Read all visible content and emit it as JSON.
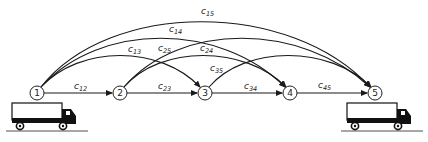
{
  "diagram": {
    "nodes": [
      {
        "id": "1",
        "label": "1",
        "x": 37,
        "y": 93
      },
      {
        "id": "2",
        "label": "2",
        "x": 120,
        "y": 93
      },
      {
        "id": "3",
        "label": "3",
        "x": 205,
        "y": 93
      },
      {
        "id": "4",
        "label": "4",
        "x": 290,
        "y": 93
      },
      {
        "id": "5",
        "label": "5",
        "x": 375,
        "y": 93
      }
    ],
    "edges": [
      {
        "from": "1",
        "to": "2",
        "label": "c",
        "sub": "12"
      },
      {
        "from": "2",
        "to": "3",
        "label": "c",
        "sub": "23"
      },
      {
        "from": "3",
        "to": "4",
        "label": "c",
        "sub": "34"
      },
      {
        "from": "4",
        "to": "5",
        "label": "c",
        "sub": "45"
      },
      {
        "from": "1",
        "to": "3",
        "label": "c",
        "sub": "13"
      },
      {
        "from": "1",
        "to": "4",
        "label": "c",
        "sub": "14"
      },
      {
        "from": "1",
        "to": "5",
        "label": "c",
        "sub": "15"
      },
      {
        "from": "2",
        "to": "4",
        "label": "c",
        "sub": "24"
      },
      {
        "from": "2",
        "to": "5",
        "label": "c",
        "sub": "25"
      },
      {
        "from": "3",
        "to": "5",
        "label": "c",
        "sub": "35"
      }
    ],
    "labels": {
      "c12": {
        "c": "c",
        "sub": "12"
      },
      "c23": {
        "c": "c",
        "sub": "23"
      },
      "c34": {
        "c": "c",
        "sub": "34"
      },
      "c45": {
        "c": "c",
        "sub": "45"
      },
      "c13": {
        "c": "c",
        "sub": "13"
      },
      "c14": {
        "c": "c",
        "sub": "14"
      },
      "c15": {
        "c": "c",
        "sub": "15"
      },
      "c24": {
        "c": "c",
        "sub": "24"
      },
      "c25": {
        "c": "c",
        "sub": "25"
      },
      "c35": {
        "c": "c",
        "sub": "35"
      }
    },
    "icons": {
      "origin": "truck-icon",
      "destination": "truck-icon"
    }
  }
}
